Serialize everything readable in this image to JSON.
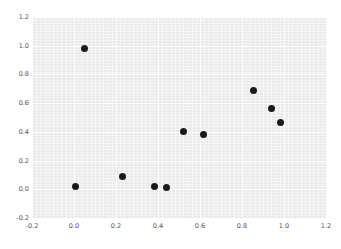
{
  "chart_data": {
    "type": "scatter",
    "title": "",
    "xlabel": "",
    "ylabel": "",
    "xlim": [
      -0.2,
      1.2
    ],
    "ylim": [
      -0.2,
      1.2
    ],
    "grid": true,
    "legend": false,
    "xticks": [
      "-0.2",
      "0.0",
      "0.2",
      "0.4",
      "0.6",
      "0.8",
      "1.0",
      "1.2"
    ],
    "xtick_values": [
      -0.2,
      0.0,
      0.2,
      0.4,
      0.6,
      0.8,
      1.0,
      1.2
    ],
    "yticks": [
      "-0.2",
      "0.0",
      "0.2",
      "0.4",
      "0.6",
      "0.8",
      "1.0",
      "1.2"
    ],
    "ytick_values": [
      -0.2,
      0.0,
      0.2,
      0.4,
      0.6,
      0.8,
      1.0,
      1.2
    ],
    "marker": "circle",
    "marker_color": "#1a1a1a",
    "marker_size": 7,
    "background_color": "#eaeaea",
    "grid_color": "#ffffff",
    "minor_grid_color": "#f5f5f5",
    "tick_label_color": "#555555",
    "points": [
      {
        "x": 0.005,
        "y": 0.02
      },
      {
        "x": 0.05,
        "y": 0.98
      },
      {
        "x": 0.23,
        "y": 0.09
      },
      {
        "x": 0.385,
        "y": 0.02
      },
      {
        "x": 0.44,
        "y": 0.015
      },
      {
        "x": 0.52,
        "y": 0.405
      },
      {
        "x": 0.615,
        "y": 0.385
      },
      {
        "x": 0.855,
        "y": 0.685
      },
      {
        "x": 0.94,
        "y": 0.565
      },
      {
        "x": 0.985,
        "y": 0.465
      }
    ]
  }
}
